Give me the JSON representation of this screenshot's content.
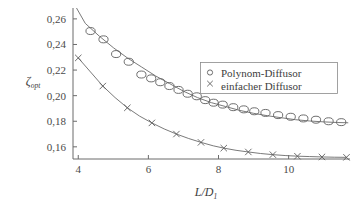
{
  "chart_data": {
    "type": "line",
    "title": "",
    "xlabel": "L/D1",
    "xlabel_parts": {
      "main": "L/D",
      "sub": "1"
    },
    "ylabel": "zeta_opt",
    "ylabel_parts": {
      "main": "ζ",
      "sub": "opt"
    },
    "xlim": [
      3.85,
      11.75
    ],
    "ylim": [
      0.1505,
      0.2685
    ],
    "xticks": [
      4,
      6,
      8,
      10
    ],
    "xticklabels": [
      "4",
      "6",
      "8",
      "10"
    ],
    "yticks": [
      0.16,
      0.18,
      0.2,
      0.22,
      0.24,
      0.26
    ],
    "yticklabels": [
      "0,16",
      "0,18",
      "0,20",
      "0,22",
      "0,24",
      "0,26"
    ],
    "grid": false,
    "legend_position": "upper-right-inside",
    "series": [
      {
        "name": "Polynom-Diffusor",
        "marker": "circle",
        "line_x": [
          3.95,
          4.2,
          4.6,
          5.0,
          5.4,
          5.8,
          6.2,
          6.6,
          7.0,
          7.4,
          7.8,
          8.2,
          8.6,
          9.0,
          9.4,
          9.8,
          10.2,
          10.6,
          11.0,
          11.4,
          11.7
        ],
        "line_y": [
          0.2685,
          0.2565,
          0.2465,
          0.2375,
          0.2295,
          0.2225,
          0.2155,
          0.2095,
          0.2035,
          0.1985,
          0.1945,
          0.1915,
          0.1885,
          0.1862,
          0.1843,
          0.1827,
          0.1812,
          0.1802,
          0.1795,
          0.179,
          0.1788
        ],
        "points_x": [
          4.35,
          4.72,
          5.08,
          5.44,
          5.8,
          6.08,
          6.34,
          6.6,
          6.86,
          7.12,
          7.38,
          7.62,
          7.86,
          8.12,
          8.42,
          8.72,
          9.02,
          9.34,
          9.7,
          10.06,
          10.42,
          10.78,
          11.14,
          11.5
        ],
        "points_y": [
          0.2505,
          0.244,
          0.2325,
          0.2265,
          0.2165,
          0.2135,
          0.2105,
          0.2075,
          0.2045,
          0.2015,
          0.1995,
          0.1965,
          0.1945,
          0.193,
          0.191,
          0.1893,
          0.1878,
          0.1865,
          0.1848,
          0.1835,
          0.1822,
          0.1812,
          0.18,
          0.1793
        ]
      },
      {
        "name": "einfacher Diffusor",
        "marker": "cross",
        "line_x": [
          4.0,
          4.35,
          4.7,
          5.05,
          5.4,
          5.75,
          6.1,
          6.45,
          6.8,
          7.15,
          7.5,
          7.85,
          8.15,
          8.5,
          8.85,
          9.2,
          9.55,
          9.9,
          10.25,
          10.6,
          10.95,
          11.3,
          11.65
        ],
        "line_y": [
          0.2295,
          0.2185,
          0.2075,
          0.1985,
          0.1905,
          0.184,
          0.1787,
          0.174,
          0.17,
          0.1665,
          0.1635,
          0.1608,
          0.159,
          0.1573,
          0.156,
          0.1548,
          0.1539,
          0.1532,
          0.1527,
          0.1524,
          0.1521,
          0.1519,
          0.1518
        ],
        "points_x": [
          4.0,
          4.7,
          5.4,
          6.1,
          6.8,
          7.5,
          8.15,
          8.85,
          9.55,
          10.25,
          10.95,
          11.65
        ],
        "points_y": [
          0.2295,
          0.2075,
          0.1905,
          0.1787,
          0.17,
          0.1635,
          0.159,
          0.156,
          0.1539,
          0.1527,
          0.1521,
          0.1518
        ]
      }
    ],
    "legend": [
      {
        "label": "Polynom-Diffusor",
        "marker": "circle"
      },
      {
        "label": "einfacher Diffusor",
        "marker": "cross"
      }
    ]
  },
  "colors": {
    "axis": "#6b6b6b",
    "curve": "#5d5d5d",
    "text": "#3d3d3d",
    "background": "#ffffff"
  }
}
